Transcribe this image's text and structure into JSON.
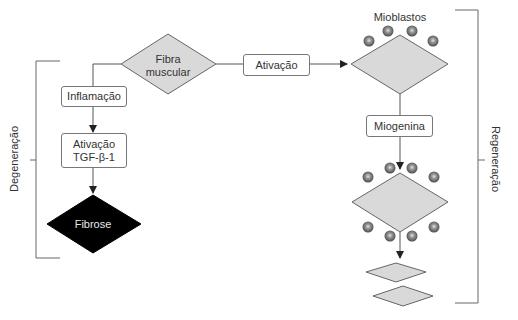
{
  "diagram": {
    "nodes": {
      "fibra_muscular": {
        "line1": "Fibra",
        "line2": "muscular"
      },
      "ativacao": "Ativação",
      "inflamacao": "Inflamação",
      "ativacao_tgf": {
        "line1": "Ativação",
        "line2": "TGF-β-1"
      },
      "fibrose": "Fibrose",
      "mioblastos": "Mioblastos",
      "miogenina": "Miogenina"
    },
    "brackets": {
      "left": "Degeneração",
      "right": "Regeneração"
    },
    "colors": {
      "diamond_fill": "#d9d9d9",
      "fibrose_fill": "#000000",
      "line": "#555555",
      "cell": "#6e6e6e"
    }
  }
}
